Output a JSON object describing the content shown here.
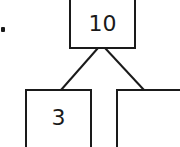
{
  "diagram": {
    "type": "number-bond",
    "whole": "10",
    "parts": [
      "3",
      ""
    ],
    "list_marker": "."
  }
}
